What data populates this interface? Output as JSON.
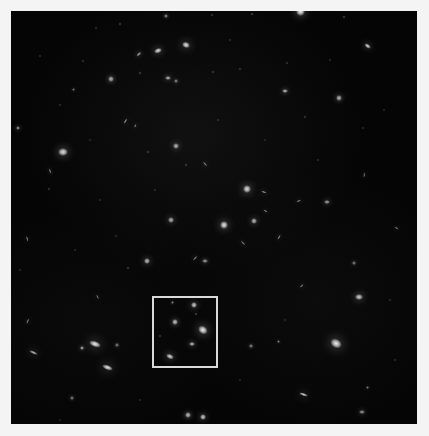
{
  "image": {
    "kind": "astronomical-deep-field",
    "width": 429,
    "height": 436,
    "matte_color": "#f4f4f4",
    "field": {
      "x": 11,
      "y": 11,
      "width": 406,
      "height": 413,
      "background_color": "#050505"
    },
    "caption": "Deep field exposure with a highlighted region of interest containing a compact galaxy group"
  },
  "roi_box": {
    "label": "region-of-interest",
    "x": 152,
    "y": 296,
    "width": 66,
    "height": 72,
    "border_color": "#d9d9d9",
    "border_width": 2
  },
  "sources": [
    {
      "x": 300,
      "y": 11,
      "rx": 4.5,
      "ry": 4.5,
      "rot": 0,
      "b": 0.95,
      "t": "star"
    },
    {
      "x": 344,
      "y": 17,
      "rx": 1.4,
      "ry": 1.4,
      "rot": 0,
      "b": 0.5,
      "t": "point"
    },
    {
      "x": 368,
      "y": 46,
      "rx": 3.6,
      "ry": 2.2,
      "rot": 35,
      "b": 0.85,
      "t": "galaxy"
    },
    {
      "x": 252,
      "y": 14,
      "rx": 1.3,
      "ry": 1.3,
      "rot": 0,
      "b": 0.45,
      "t": "point"
    },
    {
      "x": 212,
      "y": 15,
      "rx": 1.2,
      "ry": 1.2,
      "rot": 0,
      "b": 0.4,
      "t": "point"
    },
    {
      "x": 166,
      "y": 16,
      "rx": 1.6,
      "ry": 1.6,
      "rot": 0,
      "b": 0.55,
      "t": "point"
    },
    {
      "x": 120,
      "y": 24,
      "rx": 1.4,
      "ry": 1.4,
      "rot": 0,
      "b": 0.45,
      "t": "point"
    },
    {
      "x": 96,
      "y": 28,
      "rx": 1.1,
      "ry": 1.1,
      "rot": 0,
      "b": 0.35,
      "t": "point"
    },
    {
      "x": 186,
      "y": 45,
      "rx": 4.2,
      "ry": 3.0,
      "rot": 20,
      "b": 0.9,
      "t": "galaxy"
    },
    {
      "x": 158,
      "y": 51,
      "rx": 4.0,
      "ry": 2.6,
      "rot": 160,
      "b": 0.88,
      "t": "galaxy"
    },
    {
      "x": 139,
      "y": 54,
      "rx": 3.0,
      "ry": 1.3,
      "rot": 140,
      "b": 0.6,
      "t": "edge-on"
    },
    {
      "x": 140,
      "y": 73,
      "rx": 1.3,
      "ry": 1.3,
      "rot": 0,
      "b": 0.45,
      "t": "point"
    },
    {
      "x": 168,
      "y": 78,
      "rx": 3.0,
      "ry": 2.4,
      "rot": 0,
      "b": 0.7,
      "t": "galaxy"
    },
    {
      "x": 176,
      "y": 81,
      "rx": 2.0,
      "ry": 1.6,
      "rot": 0,
      "b": 0.55,
      "t": "point"
    },
    {
      "x": 111,
      "y": 79,
      "rx": 2.6,
      "ry": 2.6,
      "rot": 0,
      "b": 0.7,
      "t": "point"
    },
    {
      "x": 73,
      "y": 89,
      "rx": 1.5,
      "ry": 1.5,
      "rot": 0,
      "b": 0.45,
      "t": "point"
    },
    {
      "x": 83,
      "y": 61,
      "rx": 1.1,
      "ry": 1.1,
      "rot": 0,
      "b": 0.35,
      "t": "point"
    },
    {
      "x": 213,
      "y": 72,
      "rx": 1.2,
      "ry": 1.2,
      "rot": 0,
      "b": 0.4,
      "t": "point"
    },
    {
      "x": 240,
      "y": 69,
      "rx": 1.1,
      "ry": 1.1,
      "rot": 0,
      "b": 0.35,
      "t": "point"
    },
    {
      "x": 287,
      "y": 63,
      "rx": 1.1,
      "ry": 1.1,
      "rot": 0,
      "b": 0.35,
      "t": "point"
    },
    {
      "x": 285,
      "y": 91,
      "rx": 2.8,
      "ry": 2.4,
      "rot": 0,
      "b": 0.72,
      "t": "galaxy"
    },
    {
      "x": 339,
      "y": 98,
      "rx": 2.8,
      "ry": 2.6,
      "rot": 0,
      "b": 0.72,
      "t": "galaxy"
    },
    {
      "x": 305,
      "y": 117,
      "rx": 1.2,
      "ry": 1.2,
      "rot": 0,
      "b": 0.4,
      "t": "point"
    },
    {
      "x": 363,
      "y": 128,
      "rx": 1.0,
      "ry": 1.0,
      "rot": 0,
      "b": 0.3,
      "t": "point"
    },
    {
      "x": 125,
      "y": 121,
      "rx": 3.2,
      "ry": 1.2,
      "rot": 120,
      "b": 0.6,
      "t": "edge-on"
    },
    {
      "x": 135,
      "y": 126,
      "rx": 2.2,
      "ry": 1.0,
      "rot": 115,
      "b": 0.5,
      "t": "edge-on"
    },
    {
      "x": 18,
      "y": 128,
      "rx": 2.2,
      "ry": 2.0,
      "rot": 0,
      "b": 0.6,
      "t": "point"
    },
    {
      "x": 63,
      "y": 152,
      "rx": 4.6,
      "ry": 4.0,
      "rot": 0,
      "b": 0.88,
      "t": "galaxy"
    },
    {
      "x": 50,
      "y": 171,
      "rx": 3.0,
      "ry": 1.1,
      "rot": 70,
      "b": 0.5,
      "t": "edge-on"
    },
    {
      "x": 49,
      "y": 189,
      "rx": 1.2,
      "ry": 1.2,
      "rot": 0,
      "b": 0.4,
      "t": "point"
    },
    {
      "x": 148,
      "y": 152,
      "rx": 1.2,
      "ry": 1.2,
      "rot": 0,
      "b": 0.4,
      "t": "point"
    },
    {
      "x": 176,
      "y": 146,
      "rx": 3.2,
      "ry": 2.6,
      "rot": 0,
      "b": 0.72,
      "t": "galaxy"
    },
    {
      "x": 205,
      "y": 164,
      "rx": 3.0,
      "ry": 1.1,
      "rot": 50,
      "b": 0.5,
      "t": "edge-on"
    },
    {
      "x": 247,
      "y": 189,
      "rx": 4.4,
      "ry": 3.8,
      "rot": 0,
      "b": 0.88,
      "t": "galaxy"
    },
    {
      "x": 264,
      "y": 192,
      "rx": 2.8,
      "ry": 1.0,
      "rot": 20,
      "b": 0.55,
      "t": "edge-on"
    },
    {
      "x": 299,
      "y": 201,
      "rx": 2.6,
      "ry": 1.0,
      "rot": 160,
      "b": 0.5,
      "t": "edge-on"
    },
    {
      "x": 327,
      "y": 202,
      "rx": 2.6,
      "ry": 2.2,
      "rot": 0,
      "b": 0.65,
      "t": "point"
    },
    {
      "x": 186,
      "y": 165,
      "rx": 1.3,
      "ry": 1.3,
      "rot": 0,
      "b": 0.42,
      "t": "point"
    },
    {
      "x": 171,
      "y": 220,
      "rx": 3.2,
      "ry": 2.6,
      "rot": 0,
      "b": 0.7,
      "t": "galaxy"
    },
    {
      "x": 224,
      "y": 225,
      "rx": 4.4,
      "ry": 4.0,
      "rot": 0,
      "b": 0.9,
      "t": "star"
    },
    {
      "x": 254,
      "y": 221,
      "rx": 3.2,
      "ry": 2.8,
      "rot": 0,
      "b": 0.72,
      "t": "galaxy"
    },
    {
      "x": 27,
      "y": 239,
      "rx": 3.2,
      "ry": 1.1,
      "rot": 75,
      "b": 0.5,
      "t": "edge-on"
    },
    {
      "x": 243,
      "y": 243,
      "rx": 3.0,
      "ry": 1.1,
      "rot": 45,
      "b": 0.5,
      "t": "edge-on"
    },
    {
      "x": 279,
      "y": 237,
      "rx": 3.0,
      "ry": 1.1,
      "rot": 120,
      "b": 0.5,
      "t": "edge-on"
    },
    {
      "x": 266,
      "y": 211,
      "rx": 2.6,
      "ry": 1.0,
      "rot": 30,
      "b": 0.48,
      "t": "edge-on"
    },
    {
      "x": 147,
      "y": 261,
      "rx": 3.4,
      "ry": 2.8,
      "rot": 0,
      "b": 0.75,
      "t": "galaxy"
    },
    {
      "x": 195,
      "y": 258,
      "rx": 3.0,
      "ry": 1.1,
      "rot": 135,
      "b": 0.52,
      "t": "edge-on"
    },
    {
      "x": 205,
      "y": 261,
      "rx": 2.6,
      "ry": 2.2,
      "rot": 0,
      "b": 0.62,
      "t": "point"
    },
    {
      "x": 128,
      "y": 268,
      "rx": 1.4,
      "ry": 1.4,
      "rot": 0,
      "b": 0.45,
      "t": "point"
    },
    {
      "x": 364,
      "y": 175,
      "rx": 2.4,
      "ry": 0.9,
      "rot": 100,
      "b": 0.45,
      "t": "edge-on"
    },
    {
      "x": 396,
      "y": 228,
      "rx": 2.4,
      "ry": 1.0,
      "rot": 30,
      "b": 0.45,
      "t": "edge-on"
    },
    {
      "x": 354,
      "y": 263,
      "rx": 1.6,
      "ry": 1.6,
      "rot": 0,
      "b": 0.5,
      "t": "point"
    },
    {
      "x": 302,
      "y": 286,
      "rx": 2.6,
      "ry": 1.0,
      "rot": 140,
      "b": 0.48,
      "t": "edge-on"
    },
    {
      "x": 359,
      "y": 297,
      "rx": 3.8,
      "ry": 3.2,
      "rot": 0,
      "b": 0.82,
      "t": "galaxy"
    },
    {
      "x": 98,
      "y": 297,
      "rx": 2.6,
      "ry": 1.0,
      "rot": 65,
      "b": 0.46,
      "t": "edge-on"
    },
    {
      "x": 28,
      "y": 321,
      "rx": 2.8,
      "ry": 1.0,
      "rot": 110,
      "b": 0.48,
      "t": "edge-on"
    },
    {
      "x": 95,
      "y": 344,
      "rx": 6.0,
      "ry": 3.0,
      "rot": 20,
      "b": 0.95,
      "t": "edge-on-spiral"
    },
    {
      "x": 82,
      "y": 348,
      "rx": 2.2,
      "ry": 2.2,
      "rot": 0,
      "b": 0.7,
      "t": "point"
    },
    {
      "x": 108,
      "y": 368,
      "rx": 5.6,
      "ry": 2.6,
      "rot": 20,
      "b": 0.9,
      "t": "edge-on-spiral"
    },
    {
      "x": 33,
      "y": 352,
      "rx": 4.4,
      "ry": 1.4,
      "rot": 25,
      "b": 0.7,
      "t": "edge-on"
    },
    {
      "x": 117,
      "y": 345,
      "rx": 1.6,
      "ry": 1.6,
      "rot": 0,
      "b": 0.5,
      "t": "point"
    },
    {
      "x": 336,
      "y": 344,
      "rx": 6.2,
      "ry": 4.6,
      "rot": 30,
      "b": 0.95,
      "t": "spiral"
    },
    {
      "x": 251,
      "y": 346,
      "rx": 1.8,
      "ry": 1.8,
      "rot": 0,
      "b": 0.55,
      "t": "point"
    },
    {
      "x": 278,
      "y": 341,
      "rx": 1.5,
      "ry": 1.5,
      "rot": 0,
      "b": 0.48,
      "t": "point"
    },
    {
      "x": 304,
      "y": 395,
      "rx": 4.6,
      "ry": 1.6,
      "rot": 20,
      "b": 0.8,
      "t": "edge-on"
    },
    {
      "x": 188,
      "y": 415,
      "rx": 3.0,
      "ry": 2.6,
      "rot": 0,
      "b": 0.75,
      "t": "galaxy"
    },
    {
      "x": 203,
      "y": 417,
      "rx": 3.2,
      "ry": 2.8,
      "rot": 0,
      "b": 0.8,
      "t": "star"
    },
    {
      "x": 72,
      "y": 398,
      "rx": 1.6,
      "ry": 1.6,
      "rot": 0,
      "b": 0.5,
      "t": "point"
    },
    {
      "x": 367,
      "y": 387,
      "rx": 1.5,
      "ry": 1.5,
      "rot": 0,
      "b": 0.48,
      "t": "point"
    },
    {
      "x": 362,
      "y": 412,
      "rx": 2.6,
      "ry": 2.2,
      "rot": 0,
      "b": 0.6,
      "t": "point"
    },
    {
      "x": 172,
      "y": 302,
      "rx": 1.5,
      "ry": 1.5,
      "rot": 0,
      "b": 0.5,
      "t": "point"
    },
    {
      "x": 194,
      "y": 305,
      "rx": 3.2,
      "ry": 2.8,
      "rot": 0,
      "b": 0.8,
      "t": "galaxy"
    },
    {
      "x": 196,
      "y": 314,
      "rx": 1.3,
      "ry": 1.3,
      "rot": 0,
      "b": 0.45,
      "t": "point"
    },
    {
      "x": 175,
      "y": 322,
      "rx": 3.0,
      "ry": 2.6,
      "rot": 0,
      "b": 0.78,
      "t": "galaxy"
    },
    {
      "x": 203,
      "y": 330,
      "rx": 5.0,
      "ry": 3.8,
      "rot": 35,
      "b": 0.95,
      "t": "spiral"
    },
    {
      "x": 192,
      "y": 344,
      "rx": 2.8,
      "ry": 2.4,
      "rot": 0,
      "b": 0.75,
      "t": "galaxy"
    },
    {
      "x": 170,
      "y": 356,
      "rx": 4.0,
      "ry": 2.4,
      "rot": 25,
      "b": 0.85,
      "t": "galaxy"
    },
    {
      "x": 160,
      "y": 336,
      "rx": 1.1,
      "ry": 1.1,
      "rot": 0,
      "b": 0.35,
      "t": "point"
    },
    {
      "x": 40,
      "y": 56,
      "rx": 1.0,
      "ry": 1.0,
      "rot": 0,
      "b": 0.3,
      "t": "point"
    },
    {
      "x": 60,
      "y": 105,
      "rx": 1.0,
      "ry": 1.0,
      "rot": 0,
      "b": 0.3,
      "t": "point"
    },
    {
      "x": 100,
      "y": 200,
      "rx": 1.0,
      "ry": 1.0,
      "rot": 0,
      "b": 0.28,
      "t": "point"
    },
    {
      "x": 116,
      "y": 236,
      "rx": 1.0,
      "ry": 1.0,
      "rot": 0,
      "b": 0.3,
      "t": "point"
    },
    {
      "x": 218,
      "y": 120,
      "rx": 1.0,
      "ry": 1.0,
      "rot": 0,
      "b": 0.3,
      "t": "point"
    },
    {
      "x": 265,
      "y": 140,
      "rx": 1.0,
      "ry": 1.0,
      "rot": 0,
      "b": 0.28,
      "t": "point"
    },
    {
      "x": 318,
      "y": 160,
      "rx": 1.0,
      "ry": 1.0,
      "rot": 0,
      "b": 0.3,
      "t": "point"
    },
    {
      "x": 384,
      "y": 110,
      "rx": 1.0,
      "ry": 1.0,
      "rot": 0,
      "b": 0.28,
      "t": "point"
    },
    {
      "x": 390,
      "y": 300,
      "rx": 1.0,
      "ry": 1.0,
      "rot": 0,
      "b": 0.3,
      "t": "point"
    },
    {
      "x": 240,
      "y": 380,
      "rx": 1.0,
      "ry": 1.0,
      "rot": 0,
      "b": 0.28,
      "t": "point"
    },
    {
      "x": 140,
      "y": 400,
      "rx": 1.0,
      "ry": 1.0,
      "rot": 0,
      "b": 0.28,
      "t": "point"
    },
    {
      "x": 60,
      "y": 420,
      "rx": 1.0,
      "ry": 1.0,
      "rot": 0,
      "b": 0.25,
      "t": "point"
    },
    {
      "x": 330,
      "y": 60,
      "rx": 1.0,
      "ry": 1.0,
      "rot": 0,
      "b": 0.3,
      "t": "point"
    },
    {
      "x": 230,
      "y": 40,
      "rx": 1.0,
      "ry": 1.0,
      "rot": 0,
      "b": 0.28,
      "t": "point"
    },
    {
      "x": 90,
      "y": 140,
      "rx": 1.0,
      "ry": 1.0,
      "rot": 0,
      "b": 0.28,
      "t": "point"
    },
    {
      "x": 155,
      "y": 190,
      "rx": 1.0,
      "ry": 1.0,
      "rot": 0,
      "b": 0.3,
      "t": "point"
    },
    {
      "x": 285,
      "y": 320,
      "rx": 1.0,
      "ry": 1.0,
      "rot": 0,
      "b": 0.28,
      "t": "point"
    },
    {
      "x": 395,
      "y": 360,
      "rx": 1.0,
      "ry": 1.0,
      "rot": 0,
      "b": 0.3,
      "t": "point"
    },
    {
      "x": 20,
      "y": 270,
      "rx": 1.0,
      "ry": 1.0,
      "rot": 0,
      "b": 0.28,
      "t": "point"
    },
    {
      "x": 75,
      "y": 250,
      "rx": 1.0,
      "ry": 1.0,
      "rot": 0,
      "b": 0.28,
      "t": "point"
    }
  ]
}
